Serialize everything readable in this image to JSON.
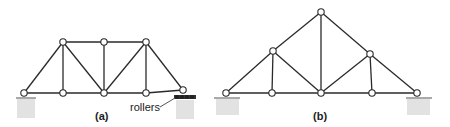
{
  "figure": {
    "truss_a": {
      "label": "(a)",
      "annotation": "rollers",
      "joints": [
        [
          24,
          93
        ],
        [
          63,
          93
        ],
        [
          104,
          93
        ],
        [
          146,
          93
        ],
        [
          183,
          90
        ],
        [
          63,
          42
        ],
        [
          104,
          42
        ],
        [
          146,
          42
        ]
      ],
      "members": [
        [
          24,
          93,
          63,
          93
        ],
        [
          63,
          93,
          104,
          93
        ],
        [
          104,
          93,
          146,
          93
        ],
        [
          146,
          93,
          183,
          90
        ],
        [
          63,
          42,
          104,
          42
        ],
        [
          104,
          42,
          146,
          42
        ],
        [
          24,
          93,
          63,
          42
        ],
        [
          63,
          42,
          63,
          93
        ],
        [
          63,
          42,
          104,
          93
        ],
        [
          104,
          42,
          104,
          93
        ],
        [
          104,
          93,
          146,
          42
        ],
        [
          146,
          42,
          146,
          93
        ],
        [
          146,
          42,
          183,
          90
        ]
      ]
    },
    "truss_b": {
      "label": "(b)",
      "joints": [
        [
          226,
          93
        ],
        [
          272,
          93
        ],
        [
          321,
          93
        ],
        [
          372,
          93
        ],
        [
          417,
          93
        ],
        [
          273,
          51
        ],
        [
          370,
          54
        ],
        [
          321,
          12
        ]
      ],
      "members": [
        [
          226,
          93,
          272,
          93
        ],
        [
          272,
          93,
          321,
          93
        ],
        [
          321,
          93,
          372,
          93
        ],
        [
          372,
          93,
          417,
          93
        ],
        [
          226,
          93,
          273,
          51
        ],
        [
          273,
          51,
          321,
          12
        ],
        [
          321,
          12,
          370,
          54
        ],
        [
          370,
          54,
          417,
          93
        ],
        [
          273,
          51,
          272,
          93
        ],
        [
          273,
          51,
          321,
          93
        ],
        [
          321,
          12,
          321,
          93
        ],
        [
          321,
          93,
          370,
          54
        ],
        [
          370,
          54,
          372,
          93
        ]
      ]
    },
    "colors": {
      "line": "#2a2a2a",
      "ground": "#e2e2e2"
    }
  }
}
